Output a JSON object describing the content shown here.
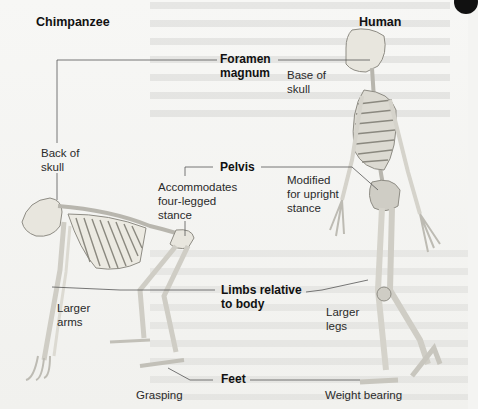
{
  "diagram": {
    "columns": {
      "left": "Chimpanzee",
      "right": "Human"
    },
    "features": [
      {
        "name": "Foramen\nmagnum",
        "chimpanzee": "Back of\nskull",
        "human": "Base of\nskull"
      },
      {
        "name": "Pelvis",
        "chimpanzee": "Accommodates\nfour-legged\nstance",
        "human": "Modified\nfor upright\nstance"
      },
      {
        "name": "Limbs relative\nto body",
        "chimpanzee": "Larger\narms",
        "human": "Larger\nlegs"
      },
      {
        "name": "Feet",
        "chimpanzee": "Grasping",
        "human": "Weight bearing"
      }
    ],
    "colors": {
      "bone": "#e9e7df",
      "bone_shadow": "#9a9890",
      "leader_line": "#555555",
      "background": "#f4f4f2"
    }
  }
}
